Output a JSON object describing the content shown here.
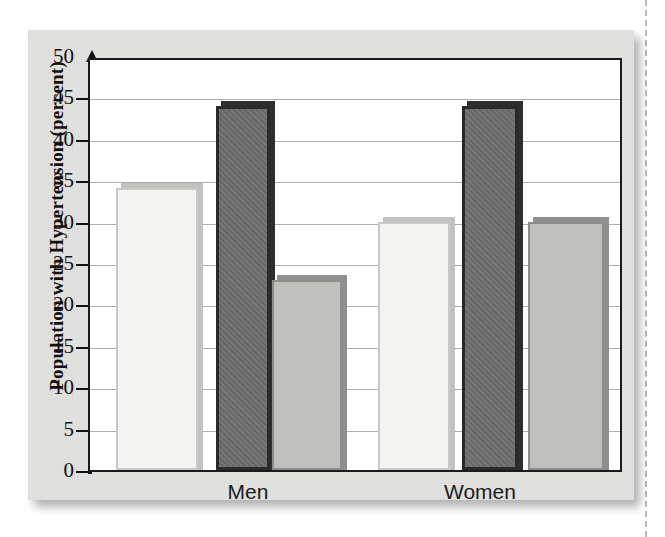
{
  "figure": {
    "media": "scanned-textbook-page",
    "background_color": "#e3e3e1",
    "plot_background_color": "#ffffff",
    "frame_color": "#1b1b1b"
  },
  "chart_data": {
    "type": "bar",
    "title": "",
    "xlabel": "",
    "ylabel": "Population with Hypertension (percent)",
    "categories": [
      "Men",
      "Women"
    ],
    "series": [
      {
        "name": "series-1",
        "style": "light",
        "color": "#f3f3f1",
        "values": [
          34,
          30
        ]
      },
      {
        "name": "series-2",
        "style": "dark",
        "color": "#6e6e6e",
        "values": [
          44,
          44
        ]
      },
      {
        "name": "series-3",
        "style": "medium",
        "color": "#c0c0be",
        "values": [
          23,
          30
        ]
      }
    ],
    "ylim": [
      0,
      50
    ],
    "ytick_labels": [
      "50",
      "45",
      "40",
      "35",
      "30",
      "25",
      "20",
      "15",
      "10",
      "5",
      "0"
    ],
    "ytick_values": [
      50,
      45,
      40,
      35,
      30,
      25,
      20,
      15,
      10,
      5,
      0
    ],
    "ytick_step": 5,
    "grid": true,
    "grid_axis": "y",
    "legend": false,
    "legend_position": "none"
  }
}
